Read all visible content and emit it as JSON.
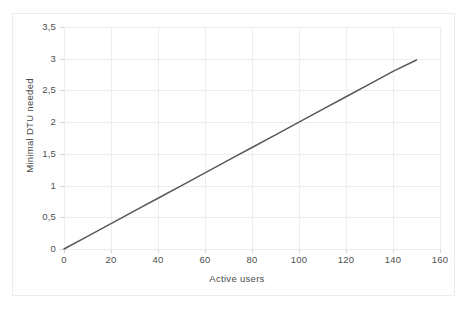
{
  "chart": {
    "background_color": "#ffffff",
    "frame_color": "#ececec",
    "grid_color": "#eaeef1",
    "axis_color": "#d4d9dd",
    "series_color": "#585858"
  },
  "chart_data": {
    "type": "line",
    "title": "",
    "subtitle": "",
    "xlabel": "Active users",
    "ylabel": "Minimal DTU needed",
    "xlim": [
      0,
      160
    ],
    "ylim": [
      0,
      3.5
    ],
    "grid": true,
    "legend": false,
    "legend_position": "none",
    "x_tick_labels": [
      "0",
      "20",
      "40",
      "60",
      "80",
      "100",
      "120",
      "140",
      "160"
    ],
    "x_ticks": [
      0,
      20,
      40,
      60,
      80,
      100,
      120,
      140,
      160
    ],
    "y_tick_labels": [
      "0",
      "0,5",
      "1",
      "1,5",
      "2",
      "2,5",
      "3",
      "3,5"
    ],
    "y_ticks": [
      0,
      0.5,
      1,
      1.5,
      2,
      2.5,
      3,
      3.5
    ],
    "decimal_separator": ",",
    "series": [
      {
        "name": "Minimal DTU needed",
        "color": "#585858",
        "line_width": 1.5,
        "x": [
          0,
          10,
          20,
          30,
          40,
          50,
          60,
          70,
          80,
          90,
          100,
          110,
          120,
          130,
          140,
          150
        ],
        "values": [
          0,
          0.2,
          0.4,
          0.6,
          0.8,
          1.0,
          1.2,
          1.4,
          1.6,
          1.8,
          2.0,
          2.2,
          2.4,
          2.6,
          2.8,
          2.98
        ]
      }
    ],
    "annotations": []
  }
}
